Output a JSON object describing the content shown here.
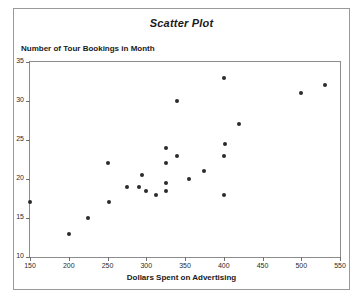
{
  "chart_data": {
    "type": "scatter",
    "title": "Scatter Plot",
    "xlabel": "Dollars Spent on Advertising",
    "ylabel": "Number of Tour Bookings in Month",
    "xlim": [
      150,
      550
    ],
    "ylim": [
      10,
      35
    ],
    "xticks": [
      150,
      200,
      250,
      300,
      350,
      400,
      450,
      500,
      550
    ],
    "yticks": [
      10,
      15,
      20,
      25,
      30,
      35
    ],
    "grid": false,
    "legend": null,
    "marker_color": "#2b2b2b",
    "points": [
      {
        "x": 150,
        "y": 17
      },
      {
        "x": 200,
        "y": 13
      },
      {
        "x": 225,
        "y": 15
      },
      {
        "x": 250,
        "y": 22
      },
      {
        "x": 252,
        "y": 17
      },
      {
        "x": 275,
        "y": 19
      },
      {
        "x": 290,
        "y": 19
      },
      {
        "x": 295,
        "y": 20.5
      },
      {
        "x": 300,
        "y": 18.5
      },
      {
        "x": 312,
        "y": 18
      },
      {
        "x": 325,
        "y": 24
      },
      {
        "x": 325,
        "y": 22
      },
      {
        "x": 325,
        "y": 19.5
      },
      {
        "x": 325,
        "y": 18.5
      },
      {
        "x": 340,
        "y": 23
      },
      {
        "x": 340,
        "y": 30
      },
      {
        "x": 355,
        "y": 20
      },
      {
        "x": 375,
        "y": 21
      },
      {
        "x": 400,
        "y": 33
      },
      {
        "x": 400,
        "y": 23
      },
      {
        "x": 400,
        "y": 18
      },
      {
        "x": 402,
        "y": 24.5
      },
      {
        "x": 420,
        "y": 27
      },
      {
        "x": 500,
        "y": 31
      },
      {
        "x": 530,
        "y": 32
      }
    ]
  }
}
